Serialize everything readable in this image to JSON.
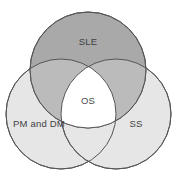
{
  "figure": {
    "type": "venn-diagram",
    "background_color": "#ffffff",
    "width": 177,
    "height": 181,
    "outline_color": "#555555",
    "outline_width": 1
  },
  "chart_data": {
    "type": "venn",
    "title": "",
    "sets": [
      {
        "id": "sle",
        "label": "SLE",
        "fill": "#a9a9a9",
        "cx": 88,
        "cy": 70,
        "r": 58,
        "label_x": 88,
        "label_y": 42
      },
      {
        "id": "pm_and_dm",
        "label": "PM and DM",
        "fill": "#e6e6e6",
        "cx": 61,
        "cy": 114,
        "r": 55,
        "label_x": 39,
        "label_y": 124
      },
      {
        "id": "ss",
        "label": "SS",
        "fill": "#e6e6e6",
        "cx": 116,
        "cy": 114,
        "r": 55,
        "label_x": 136,
        "label_y": 124
      }
    ],
    "intersections": [
      {
        "id": "center",
        "label": "OS",
        "members": [
          "sle",
          "pm_and_dm",
          "ss"
        ],
        "fill": "#ffffff",
        "label_x": 88,
        "label_y": 101
      }
    ]
  }
}
